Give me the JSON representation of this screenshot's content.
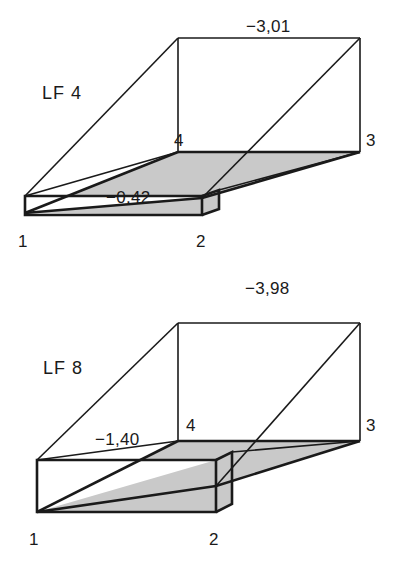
{
  "page": {
    "background_color": "#ffffff",
    "line_color": "#1a1a1a",
    "fill_gray": "#c9c9c9",
    "width": 404,
    "height": 570
  },
  "figures": [
    {
      "id": "figure-lf4",
      "name_label": "LF 4",
      "top_value": "−3,01",
      "front_value": "−0,42",
      "nodes": {
        "n1": "1",
        "n2": "2",
        "n3": "3",
        "n4": "4"
      }
    },
    {
      "id": "figure-lf8",
      "name_label": "LF 8",
      "top_value": "−3,98",
      "front_value": "−1,40",
      "nodes": {
        "n1": "1",
        "n2": "2",
        "n3": "3",
        "n4": "4"
      }
    }
  ]
}
